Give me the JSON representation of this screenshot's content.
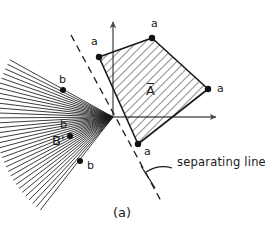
{
  "figure": {
    "caption": "(a)",
    "axes": {
      "origin": [
        113,
        117
      ],
      "x_axis_end": [
        222,
        117
      ],
      "y_axis_end": [
        113,
        16
      ],
      "color": "#5a5a5a"
    },
    "set_a": {
      "label": "A",
      "label_overline": true,
      "label_pos": [
        152,
        90
      ],
      "vertex_label": "a",
      "vertices": [
        {
          "x": 99,
          "y": 57,
          "label": "a",
          "label_x": 91,
          "label_y": 42
        },
        {
          "x": 152,
          "y": 38,
          "label": "a",
          "label_x": 151,
          "label_y": 24
        },
        {
          "x": 208,
          "y": 89,
          "label": "a",
          "label_x": 218,
          "label_y": 85
        },
        {
          "x": 138,
          "y": 144,
          "label": "a",
          "label_x": 144,
          "label_y": 149
        }
      ],
      "hatch_color": "#1a1a1a",
      "edge_color": "#1a1a1a"
    },
    "set_b": {
      "label": "B'",
      "label_pos": [
        58,
        143
      ],
      "apex": [
        113,
        117
      ],
      "cone_start_angle_deg": 151,
      "cone_end_angle_deg": 232,
      "ray_count": 34,
      "ray_length": 118,
      "points": [
        {
          "x": 63,
          "y": 90,
          "label": "b",
          "label_x": 60,
          "label_y": 77
        },
        {
          "x": 70,
          "y": 136,
          "label": "b",
          "label_x": 60,
          "label_y": 122
        },
        {
          "x": 80,
          "y": 161,
          "label": "b",
          "label_x": 87,
          "label_y": 163
        }
      ],
      "ray_color": "#1a1a1a"
    },
    "separating_line": {
      "label": "separating line",
      "label_pos": [
        178,
        163
      ],
      "start": [
        71,
        35
      ],
      "end": [
        161,
        201
      ],
      "dash": "7 5",
      "color": "#1a1a1a",
      "leader_from": [
        172,
        168
      ],
      "leader_to": [
        146,
        172
      ],
      "tick_start": [
        141,
        166
      ],
      "tick_end": [
        155,
        188
      ]
    },
    "caption_pos": [
      116,
      212
    ]
  }
}
